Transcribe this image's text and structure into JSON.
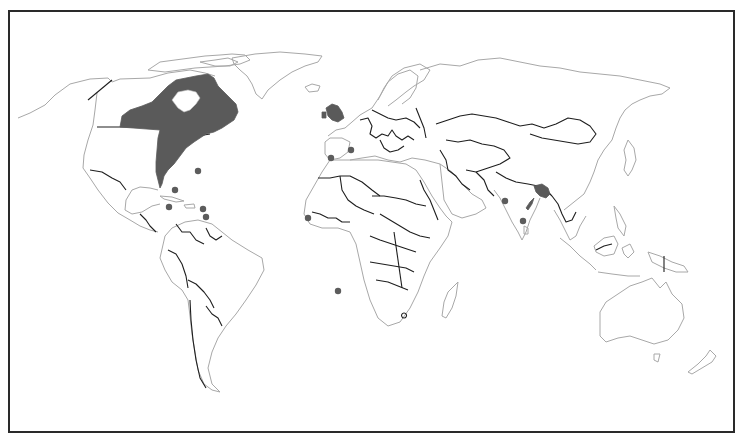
{
  "map": {
    "type": "species-distribution",
    "projection": "equirectangular-like world map",
    "frame": {
      "x": 8,
      "y": 10,
      "width": 726,
      "height": 422,
      "border_color": "#2a2a2a"
    },
    "colors": {
      "background": "#ffffff",
      "coastline": "#a8a8a8",
      "country_border": "#1e1e1e",
      "range_fill": "#5a5a5a",
      "occurrence_dot": "#5c5c5c"
    },
    "shaded_regions": [
      {
        "name": "eastern-north-america",
        "label": "Eastern Canada and eastern United States"
      },
      {
        "name": "british-isles",
        "label": "Great Britain and Ireland"
      },
      {
        "name": "bangladesh-ne-india",
        "label": "Bangladesh / northeastern India"
      },
      {
        "name": "east-india-coast-streak",
        "label": "Eastern India coastal streak"
      }
    ],
    "occurrence_points": [
      {
        "id": 1,
        "region": "Bermuda",
        "x": 198,
        "y": 171
      },
      {
        "id": 2,
        "region": "Bahamas",
        "x": 175,
        "y": 190
      },
      {
        "id": 3,
        "region": "Jamaica",
        "x": 169,
        "y": 207
      },
      {
        "id": 4,
        "region": "Lesser Antilles north",
        "x": 203,
        "y": 209
      },
      {
        "id": 5,
        "region": "Lesser Antilles south",
        "x": 206,
        "y": 217
      },
      {
        "id": 6,
        "region": "Iberia / Portugal",
        "x": 331,
        "y": 158
      },
      {
        "id": 7,
        "region": "Southern France",
        "x": 351,
        "y": 150
      },
      {
        "id": 8,
        "region": "Senegal coast",
        "x": 308,
        "y": 218
      },
      {
        "id": 9,
        "region": "South Atlantic (St Helena)",
        "x": 338,
        "y": 291
      },
      {
        "id": 10,
        "region": "Western India",
        "x": 505,
        "y": 201
      },
      {
        "id": 11,
        "region": "Southern India",
        "x": 523,
        "y": 221
      }
    ]
  }
}
